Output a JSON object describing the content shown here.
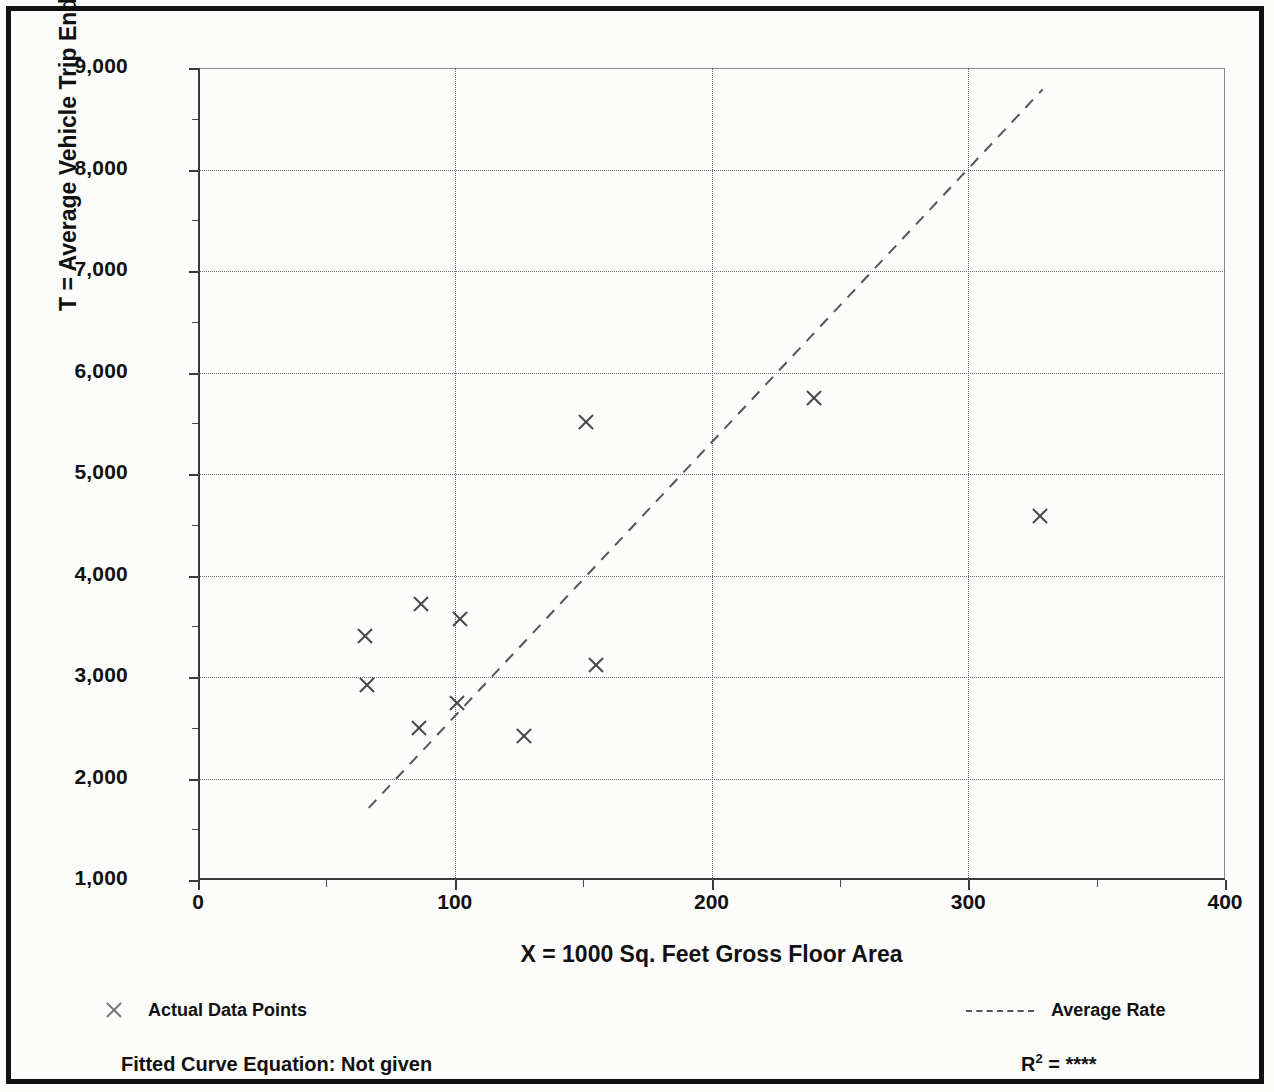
{
  "chart_data": {
    "type": "scatter",
    "title": "",
    "xlabel": "X = 1000 Sq. Feet Gross Floor Area",
    "ylabel": "T = Average Vehicle Trip Ends",
    "xlim": [
      0,
      400
    ],
    "ylim": [
      1000,
      9000
    ],
    "x_ticks": [
      0,
      100,
      200,
      300,
      400
    ],
    "x_tick_labels": [
      "0",
      "100",
      "200",
      "300",
      "400"
    ],
    "x_minor_ticks": [
      50,
      150,
      250,
      350
    ],
    "y_ticks": [
      1000,
      2000,
      3000,
      4000,
      5000,
      6000,
      7000,
      8000,
      9000
    ],
    "y_tick_labels": [
      "1,000",
      "2,000",
      "3,000",
      "4,000",
      "5,000",
      "6,000",
      "7,000",
      "8,000",
      "9,000"
    ],
    "y_minor_ticks": [
      1500,
      2500,
      3500,
      4500,
      5500,
      6500,
      7500,
      8500
    ],
    "grid": true,
    "grid_style": "dotted",
    "legend_position": "below-plot",
    "series": [
      {
        "name": "Actual Data Points",
        "type": "scatter",
        "marker": "x",
        "points": [
          {
            "x": 65,
            "y": 3400
          },
          {
            "x": 66,
            "y": 2920
          },
          {
            "x": 87,
            "y": 3720
          },
          {
            "x": 86,
            "y": 2500
          },
          {
            "x": 102,
            "y": 3570
          },
          {
            "x": 101,
            "y": 2740
          },
          {
            "x": 127,
            "y": 2420
          },
          {
            "x": 151,
            "y": 5510
          },
          {
            "x": 155,
            "y": 3120
          },
          {
            "x": 240,
            "y": 5750
          },
          {
            "x": 328,
            "y": 4590
          }
        ]
      },
      {
        "name": "Average Rate",
        "type": "line",
        "style": "dashed",
        "endpoints": [
          {
            "x": 66.5,
            "y": 1710
          },
          {
            "x": 329,
            "y": 8790
          }
        ]
      }
    ],
    "annotations": {
      "fitted_curve_equation": "Fitted Curve Equation:  Not given",
      "r_squared_label": "R",
      "r_squared_exponent": "2",
      "r_squared_value": "****"
    }
  },
  "legend": {
    "data_points_label": "Actual Data Points",
    "average_rate_label": "Average Rate"
  }
}
